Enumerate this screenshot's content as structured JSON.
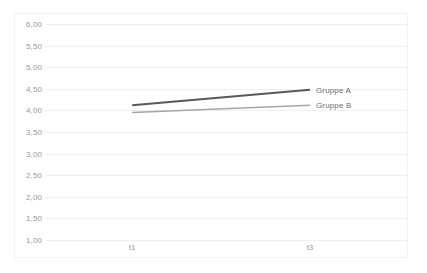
{
  "chart_data": {
    "type": "line",
    "title": "",
    "subtitle": "",
    "xlabel": "",
    "ylabel": "",
    "categories": [
      "t1",
      "t3"
    ],
    "x": [
      "t1",
      "t3"
    ],
    "ylim": [
      1.0,
      6.0
    ],
    "ytick_step": 0.5,
    "ytick_labels": [
      "6,00",
      "5,50",
      "5,00",
      "4,50",
      "4,00",
      "3,50",
      "3,00",
      "2,50",
      "2,00",
      "1,50",
      "1,00"
    ],
    "ytick_values": [
      6.0,
      5.5,
      5.0,
      4.5,
      4.0,
      3.5,
      3.0,
      2.5,
      2.0,
      1.5,
      1.0
    ],
    "xtick_labels": [
      "t1",
      "t3"
    ],
    "grid": true,
    "grid_axis": "y",
    "legend_position": "right-inline-end-of-line",
    "series": [
      {
        "name": "Gruppe A",
        "label": "Gruppe A",
        "color": "#595959",
        "width": 2.0,
        "values": [
          4.12,
          4.48
        ]
      },
      {
        "name": "Gruppe B",
        "label": "Gruppe B",
        "color": "#a6a6a6",
        "width": 1.6,
        "values": [
          3.95,
          4.12
        ]
      }
    ]
  },
  "axes": {
    "y_tick_0": "6,00",
    "y_tick_1": "5,50",
    "y_tick_2": "5,00",
    "y_tick_3": "4,50",
    "y_tick_4": "4,00",
    "y_tick_5": "3,50",
    "y_tick_6": "3,00",
    "y_tick_7": "2,50",
    "y_tick_8": "2,00",
    "y_tick_9": "1,50",
    "y_tick_10": "1,00",
    "x_tick_0": "t1",
    "x_tick_1": "t3"
  },
  "legend": {
    "series_a_label": "Gruppe A",
    "series_b_label": "Gruppe B"
  },
  "colors": {
    "series_a": "#595959",
    "series_b": "#a6a6a6",
    "gridline": "#f0f0f0",
    "tick_text": "#9a9a9a",
    "label_text": "#6b6b6b",
    "frame": "#f2f2f2",
    "background": "#ffffff"
  }
}
